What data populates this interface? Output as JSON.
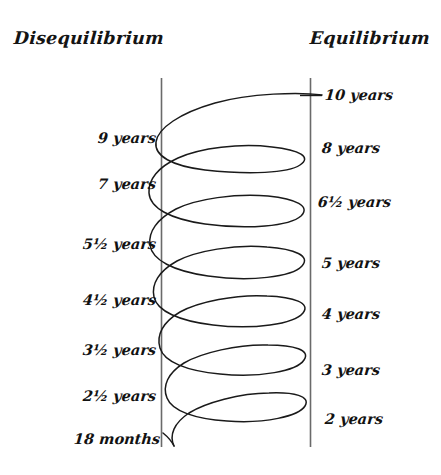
{
  "diagram": {
    "title_left": "Disequilibrium",
    "title_right": "Equilibrium",
    "type": "hand-drawn-spiral-oscillation",
    "ink_color": "#111111",
    "axis_color": "#555555",
    "background_color": "#ffffff",
    "axes": {
      "left_axis_label": "Disequilibrium",
      "right_axis_label": "Equilibrium"
    },
    "left_labels": [
      {
        "text": "9 years",
        "value": "9 years",
        "y": 140
      },
      {
        "text": "7 years",
        "value": "7 years",
        "y": 186
      },
      {
        "text": "5½ years",
        "value": "5.5 years",
        "y": 246
      },
      {
        "text": "4½ years",
        "value": "4.5 years",
        "y": 302
      },
      {
        "text": "3½ years",
        "value": "3.5 years",
        "y": 352
      },
      {
        "text": "2½ years",
        "value": "2.5 years",
        "y": 398
      },
      {
        "text": "18 months",
        "value": "1.5 years",
        "y": 441
      }
    ],
    "right_labels": [
      {
        "text": "10 years",
        "value": "10 years",
        "y": 97
      },
      {
        "text": "8 years",
        "value": "8 years",
        "y": 150
      },
      {
        "text": "6½ years",
        "value": "6.5 years",
        "y": 204
      },
      {
        "text": "5 years",
        "value": "5 years",
        "y": 265
      },
      {
        "text": "4 years",
        "value": "4 years",
        "y": 316
      },
      {
        "text": "3 years",
        "value": "3 years",
        "y": 372
      },
      {
        "text": "2 years",
        "value": "2 years",
        "y": 421
      }
    ]
  }
}
